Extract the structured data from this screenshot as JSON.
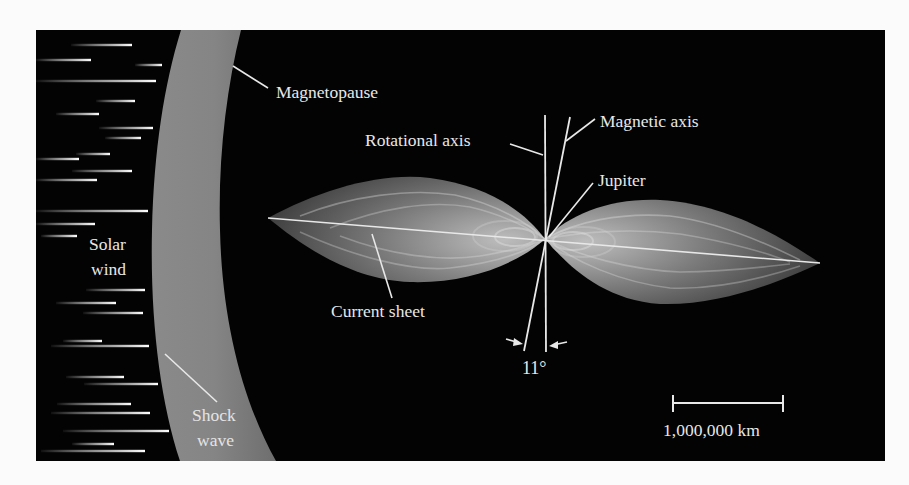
{
  "figure": {
    "background": "#030303",
    "band_color": "#808080",
    "line_color": "#e8e8e8"
  },
  "labels": {
    "magnetopause": "Magnetopause",
    "rotational_axis": "Rotational axis",
    "magnetic_axis": "Magnetic axis",
    "jupiter": "Jupiter",
    "solar_wind_line1": "Solar",
    "solar_wind_line2": "wind",
    "current_sheet": "Current sheet",
    "shock_wave_line1": "Shock",
    "shock_wave_line2": "wave",
    "tilt_angle": "11°"
  },
  "scale_bar": {
    "label": "1,000,000 km",
    "length_px": 110
  },
  "solar_wind_streaks": [
    [
      71,
      132,
      45
    ],
    [
      36,
      91,
      60
    ],
    [
      135,
      162,
      65
    ],
    [
      36,
      156,
      81
    ],
    [
      96,
      135,
      101
    ],
    [
      56,
      99,
      114
    ],
    [
      99,
      153,
      128
    ],
    [
      105,
      141,
      138
    ],
    [
      76,
      110,
      154
    ],
    [
      36,
      79,
      159
    ],
    [
      72,
      132,
      171
    ],
    [
      36,
      97,
      180
    ],
    [
      36,
      148,
      211
    ],
    [
      36,
      95,
      224
    ],
    [
      41,
      77,
      236
    ],
    [
      86,
      145,
      290
    ],
    [
      56,
      116,
      303
    ],
    [
      83,
      143,
      313
    ],
    [
      63,
      102,
      341
    ],
    [
      51,
      149,
      346
    ],
    [
      66,
      124,
      377
    ],
    [
      84,
      158,
      384
    ],
    [
      57,
      131,
      404
    ],
    [
      51,
      150,
      413
    ],
    [
      63,
      169,
      431
    ],
    [
      72,
      114,
      444
    ],
    [
      41,
      145,
      451
    ]
  ]
}
